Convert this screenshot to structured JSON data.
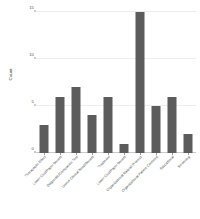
{
  "chart_data": {
    "type": "bar",
    "title": "",
    "xlabel": "",
    "ylabel": "Count",
    "ylim": [
      0,
      15
    ],
    "yticks": [
      0,
      5,
      10,
      15
    ],
    "grid": true,
    "legend": false,
    "bar_color": "#5c5c5c",
    "grid_color": "#ededed",
    "categories": [
      "Therapeutic Effect",
      "Lower Cost/Payer Benefit",
      "Diagnostic/Companion Test",
      "Unmet Clinical Need/Benefit",
      "Treatment",
      "Lower Cost/Payer Benefit",
      "Organizational Natural Process",
      "Organizational Patient Centered",
      "Educational",
      "Screening"
    ],
    "values": [
      3,
      6,
      7,
      4,
      6,
      1,
      15,
      5,
      6,
      2
    ]
  },
  "axis": {
    "y_title": "Count"
  }
}
